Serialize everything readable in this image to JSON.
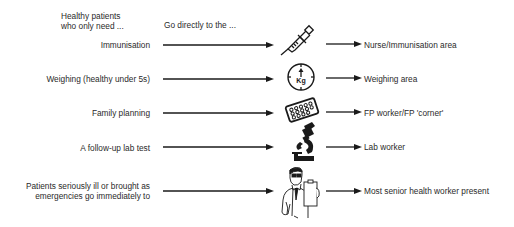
{
  "header": {
    "left_line1": "Healthy patients",
    "left_line2": "who only need ...",
    "right": "Go directly to the ..."
  },
  "rows": [
    {
      "need": "Immunisation",
      "icon": "syringe-icon",
      "destination": "Nurse/Immunisation area"
    },
    {
      "need": "Weighing (healthy under 5s)",
      "icon": "scale-kg-icon",
      "destination": "Weighing area"
    },
    {
      "need": "Family planning",
      "icon": "pill-pack-icon",
      "destination": "FP worker/FP 'corner'"
    },
    {
      "need": "A follow-up lab test",
      "icon": "microscope-icon",
      "destination": "Lab worker"
    },
    {
      "need_line1": "Patients seriously ill or brought as",
      "need_line2": "emergencies go immediately to",
      "icon": "doctor-icon",
      "destination": "Most senior health worker present"
    }
  ],
  "icon_labels": {
    "scale_unit": "Kg"
  },
  "colors": {
    "text": "#2a2a2a",
    "lines": "#1a1a1a"
  }
}
